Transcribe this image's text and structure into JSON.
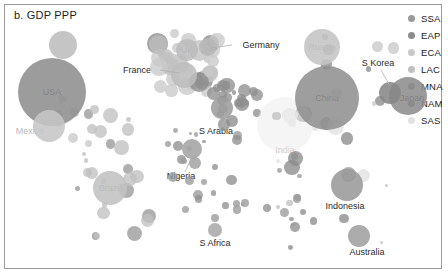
{
  "chart_title": "b. GDP PPP",
  "legend": {
    "position": "right",
    "items": [
      {
        "code": "SSA",
        "color": "#9a9a9a"
      },
      {
        "code": "EAP",
        "color": "#8c8c8c"
      },
      {
        "code": "ECA",
        "color": "#c9c9c9"
      },
      {
        "code": "LAC",
        "color": "#c0c0c0"
      },
      {
        "code": "MNA",
        "color": "#8f8f8f"
      },
      {
        "code": "NAM",
        "color": "#7e7e7e"
      },
      {
        "code": "SAS",
        "color": "#e2e2e2"
      }
    ]
  },
  "chart_data": {
    "type": "scatter",
    "title": "b. GDP PPP",
    "xlabel": "",
    "ylabel": "",
    "grid": false,
    "legend_position": "right",
    "size_encoding": "GDP PPP",
    "color_encoding": "World Bank region",
    "legend_entries": [
      "SSA",
      "EAP",
      "ECA",
      "LAC",
      "MNA",
      "NAM",
      "SAS"
    ],
    "labeled_points": [
      {
        "label": "USA",
        "region": "NAM",
        "x": 52,
        "y": 92,
        "r": 34,
        "color": "#8e8e8e"
      },
      {
        "label": "Mexico",
        "region": "LAC",
        "x": 49,
        "y": 126,
        "r": 16,
        "color": "#c6c6c6"
      },
      {
        "label": "Brazil",
        "region": "LAC",
        "x": 110,
        "y": 188,
        "r": 17,
        "color": "#c2c2c2"
      },
      {
        "label": "Germany",
        "region": "ECA",
        "x": 208,
        "y": 47,
        "r": 9,
        "color": "#b7b7b7"
      },
      {
        "label": "France",
        "region": "ECA",
        "x": 184,
        "y": 75,
        "r": 13,
        "color": "#bdbdbd"
      },
      {
        "label": "UK",
        "region": "ECA",
        "x": 187,
        "y": 50,
        "r": 11,
        "color": "#bcbcbc"
      },
      {
        "label": "Russia",
        "region": "ECA",
        "x": 322,
        "y": 47,
        "r": 18,
        "color": "#c4c4c4"
      },
      {
        "label": "S Arabia",
        "region": "MNA",
        "x": 222,
        "y": 108,
        "r": 11,
        "color": "#9d9d9d"
      },
      {
        "label": "Nigeria",
        "region": "SSA",
        "x": 192,
        "y": 149,
        "r": 10,
        "color": "#a4a4a4"
      },
      {
        "label": "S Africa",
        "region": "SSA",
        "x": 215,
        "y": 230,
        "r": 7,
        "color": "#a8a8a8"
      },
      {
        "label": "India",
        "region": "SAS",
        "x": 285,
        "y": 125,
        "r": 28,
        "color": "#ececec"
      },
      {
        "label": "China",
        "region": "EAP",
        "x": 327,
        "y": 98,
        "r": 32,
        "color": "#919191"
      },
      {
        "label": "S Korea",
        "region": "EAP",
        "x": 390,
        "y": 93,
        "r": 11,
        "color": "#868686"
      },
      {
        "label": "Japan",
        "region": "EAP",
        "x": 408,
        "y": 96,
        "r": 19,
        "color": "#8d8d8d"
      },
      {
        "label": "Indonesia",
        "region": "EAP",
        "x": 347,
        "y": 185,
        "r": 16,
        "color": "#9a9a9a"
      },
      {
        "label": "Australia",
        "region": "EAP",
        "x": 359,
        "y": 236,
        "r": 11,
        "color": "#a0a0a0"
      },
      {
        "label": "Canada",
        "region": "NAM",
        "x": 63,
        "y": 45,
        "r": 14,
        "color": "#bdbdbd"
      }
    ]
  },
  "labels": {
    "usa": "USA",
    "mexico": "Mexico",
    "brazil": "Brazil",
    "germany": "Germany",
    "france": "France",
    "uk": "UK",
    "russia": "Russia",
    "s_arabia": "S Arabia",
    "nigeria": "Nigeria",
    "s_africa": "S Africa",
    "india": "India",
    "china": "China",
    "s_korea": "S Korea",
    "japan": "Japan",
    "indonesia": "Indonesia",
    "australia": "Australia"
  }
}
